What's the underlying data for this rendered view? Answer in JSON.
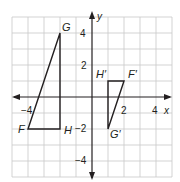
{
  "figure": {
    "axis_labels": {
      "x": "x",
      "y": "y"
    },
    "x_ticks": [
      {
        "value": -4,
        "label": "−4"
      },
      {
        "value": 2,
        "label": "2"
      },
      {
        "value": 4,
        "label": "4"
      }
    ],
    "y_ticks": [
      {
        "value": 4,
        "label": "4"
      },
      {
        "value": 2,
        "label": "2"
      },
      {
        "value": -2,
        "label": "−2"
      },
      {
        "value": -4,
        "label": "−4"
      }
    ],
    "grid": {
      "xmin": -5,
      "xmax": 5,
      "ymin": -5,
      "ymax": 5,
      "step": 1
    },
    "colors": {
      "grid": "#c8c8c8",
      "axis": "#231f20",
      "shape": "#231f20"
    },
    "triangles": [
      {
        "name": "FGH",
        "vertices": [
          {
            "label": "F",
            "x": -4,
            "y": -2
          },
          {
            "label": "G",
            "x": -2,
            "y": 4
          },
          {
            "label": "H",
            "x": -2,
            "y": -2
          }
        ]
      },
      {
        "name": "F'G'H'",
        "vertices": [
          {
            "label": "F′",
            "x": 2,
            "y": 1
          },
          {
            "label": "G′",
            "x": 1,
            "y": -2
          },
          {
            "label": "H′",
            "x": 1,
            "y": 1
          }
        ]
      }
    ]
  }
}
